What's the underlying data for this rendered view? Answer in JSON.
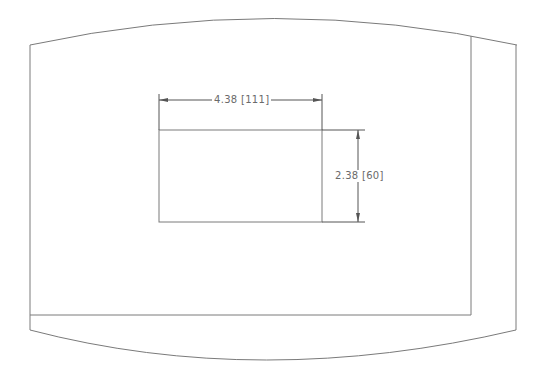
{
  "drawing": {
    "type": "technical-dimension-drawing",
    "line_color": "#7a7a7a",
    "cutout": {
      "width_label": "4.38 [111]",
      "height_label": "2.38 [60]",
      "width_in": 4.38,
      "width_mm": 111,
      "height_in": 2.38,
      "height_mm": 60
    }
  }
}
